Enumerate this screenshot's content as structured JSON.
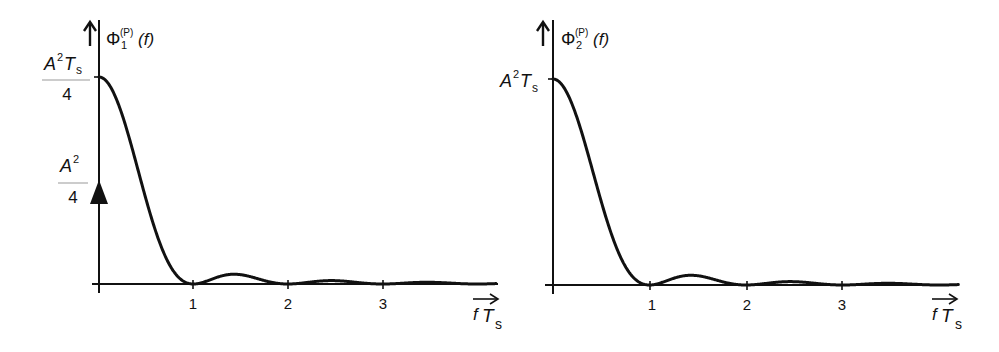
{
  "figure": {
    "left_panel": {
      "ylabel_main": "Φ",
      "ylabel_sub": "1",
      "ylabel_sup": "(P)",
      "ylabel_arg": "(f)",
      "peak_label_num": "A",
      "peak_label_num_sup": "2",
      "peak_label_num_T": "T",
      "peak_label_num_T_sub": "s",
      "peak_label_den": "4",
      "dirac_label_num": "A",
      "dirac_label_num_sup": "2",
      "dirac_label_den": "4",
      "xticks": [
        "1",
        "2",
        "3"
      ],
      "xlabel_f": "f",
      "xlabel_T": "T",
      "xlabel_sub": "s"
    },
    "right_panel": {
      "ylabel_main": "Φ",
      "ylabel_sub": "2",
      "ylabel_sup": "(P)",
      "ylabel_arg": "(f)",
      "peak_label": "A",
      "peak_label_sup": "2",
      "peak_label_T": "T",
      "peak_label_T_sub": "s",
      "xticks": [
        "1",
        "2",
        "3"
      ],
      "xlabel_f": "f",
      "xlabel_T": "T",
      "xlabel_sub": "s"
    }
  },
  "chart_data": [
    {
      "type": "line",
      "title": "Φ1(P)(f)",
      "xlabel": "f Ts",
      "ylabel": "Φ1(P)(f)",
      "xlim": [
        0,
        4.2
      ],
      "xticks": [
        1,
        2,
        3
      ],
      "continuous_peak": "A²Ts/4",
      "dirac_at_zero": {
        "x": 0,
        "weight": "A²/4"
      },
      "shape": "(A²Ts/4)·sinc²(f Ts)",
      "x": [
        0,
        0.25,
        0.5,
        0.75,
        1,
        1.43,
        2,
        2.46,
        3,
        3.47,
        4
      ],
      "values_normalized": [
        1.0,
        0.81,
        0.405,
        0.09,
        0.0,
        0.047,
        0.0,
        0.016,
        0.0,
        0.008,
        0.0
      ]
    },
    {
      "type": "line",
      "title": "Φ2(P)(f)",
      "xlabel": "f Ts",
      "ylabel": "Φ2(P)(f)",
      "xlim": [
        0,
        4.2
      ],
      "xticks": [
        1,
        2,
        3
      ],
      "continuous_peak": "A²Ts",
      "shape": "A²Ts·sinc²(f Ts)",
      "x": [
        0,
        0.25,
        0.5,
        0.75,
        1,
        1.43,
        2,
        2.46,
        3,
        3.47,
        4
      ],
      "values_normalized": [
        1.0,
        0.81,
        0.405,
        0.09,
        0.0,
        0.047,
        0.0,
        0.016,
        0.0,
        0.008,
        0.0
      ]
    }
  ]
}
